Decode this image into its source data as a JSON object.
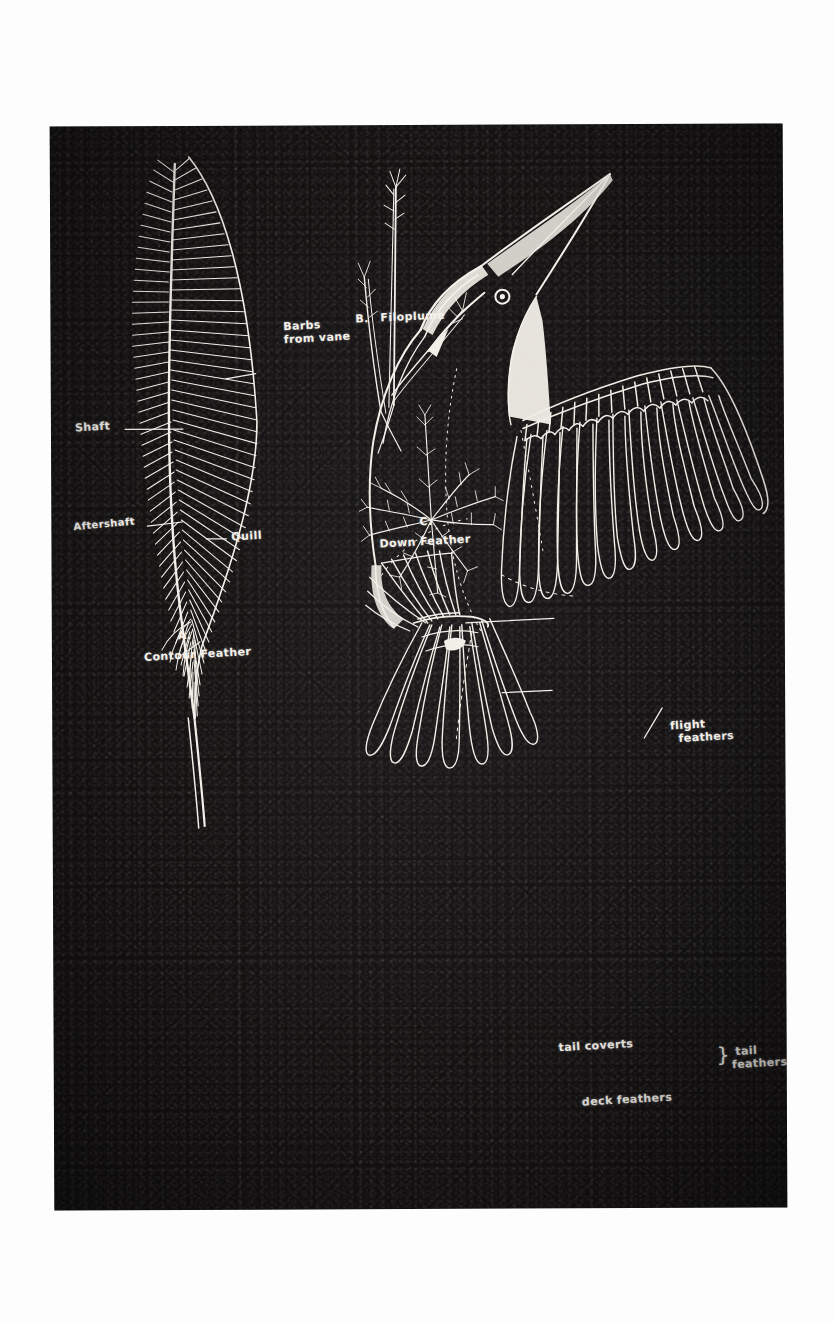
{
  "document": {
    "kind": "scanned-illustration-page",
    "title": "Feather Types",
    "background_color": "#ffffff",
    "plate_color": "#141212",
    "chalk_color": "#f2efe8"
  },
  "figures": [
    {
      "id": "contour-feather",
      "caption_letter": "A.",
      "caption": "Contour Feather",
      "labels": [
        {
          "id": "barbs",
          "text_line1": "Barbs",
          "text_line2": "from vane",
          "full": "Barbs from vane"
        },
        {
          "id": "shaft",
          "text_line1": "Shaft",
          "text_line2": "",
          "full": "Shaft"
        },
        {
          "id": "aftershaft",
          "text_line1": "Aftershaft",
          "text_line2": "",
          "full": "Aftershaft"
        },
        {
          "id": "quill",
          "text_line1": "Quill",
          "text_line2": "",
          "full": "Quill"
        }
      ]
    },
    {
      "id": "filoplume",
      "caption_letter": "B.",
      "caption": "Filoplume",
      "labels": []
    },
    {
      "id": "down-feather",
      "caption_letter": "C.",
      "caption": "Down Feather",
      "labels": []
    },
    {
      "id": "bird",
      "caption_letter": "",
      "caption": "",
      "labels": [
        {
          "id": "flight-feathers",
          "text_line1": "flight",
          "text_line2": "feathers",
          "full": "flight feathers"
        },
        {
          "id": "tail-coverts",
          "text_line1": "tail coverts",
          "text_line2": "",
          "full": "tail coverts"
        },
        {
          "id": "deck-feathers",
          "text_line1": "deck feathers",
          "text_line2": "",
          "full": "deck feathers"
        },
        {
          "id": "tail-feathers",
          "text_line1": "tail",
          "text_line2": "feathers",
          "full": "tail feathers",
          "bracket": "}"
        }
      ]
    }
  ],
  "captions": {
    "a_letter": "A.",
    "a_name": "Contour Feather",
    "b_letter": "B.",
    "b_name": "Filoplume",
    "c_letter": "C.",
    "c_name": "Down Feather"
  },
  "callouts": {
    "barbs_l1": "Barbs",
    "barbs_l2": "from vane",
    "shaft": "Shaft",
    "aftershaft": "Aftershaft",
    "quill": "Quill",
    "flight_l1": "flight",
    "flight_l2": "feathers",
    "tail_coverts": "tail coverts",
    "deck_feathers": "deck feathers",
    "tail_l1": "tail",
    "tail_l2": "feathers",
    "tail_bracket": "}"
  }
}
